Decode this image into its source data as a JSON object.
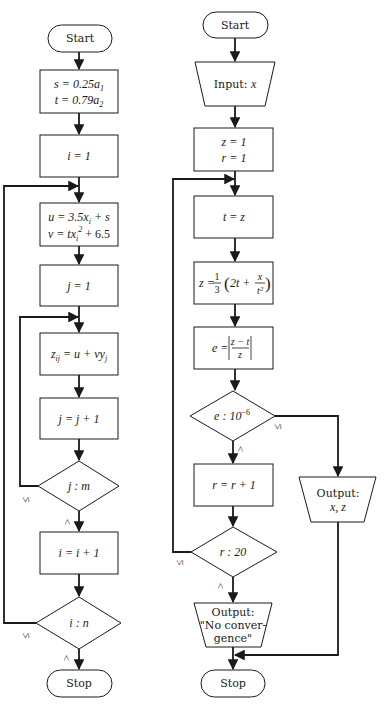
{
  "left_flowchart": {
    "start": "Start",
    "init_s": "s = 0.25a",
    "init_s_sub": "1",
    "init_t": "t = 0.79a",
    "init_t_sub": "2",
    "i_init": "i = 1",
    "u_expr": "u = 3.5x",
    "u_sub": "i",
    "u_tail": " + s",
    "v_expr": "v = tx",
    "v_sub": "i",
    "v_sup": "2",
    "v_tail": " + 6.5",
    "j_init": "j = 1",
    "z_expr": "z",
    "z_sub": "ij",
    "z_tail": " = u + vy",
    "z_tail_sub": "j",
    "j_inc": "j = j + 1",
    "j_test": "j : m",
    "j_test_le": "≤",
    "j_test_gt": ">",
    "i_inc": "i = i + 1",
    "i_test": "i : n",
    "i_test_le": "≤",
    "i_test_gt": ">",
    "stop": "Stop"
  },
  "right_flowchart": {
    "start": "Start",
    "input": "Input: ",
    "input_var": "x",
    "init_z": "z = 1",
    "init_r": "r = 1",
    "t_assign": "t = z",
    "z_update_lhs": "z = ",
    "z_update_frac_num": "1",
    "z_update_frac_den": "3",
    "z_update_body": "2t + ",
    "z_update_inner_num": "x",
    "z_update_inner_den": "t²",
    "e_lhs": "e = ",
    "e_num": "z − t",
    "e_den": "z",
    "e_test": "e : 10",
    "e_test_exp": "−6",
    "e_test_le": "≤",
    "e_test_gt": ">",
    "r_inc": "r = r + 1",
    "r_test": "r : 20",
    "r_test_le": "≤",
    "r_test_gt": ">",
    "output_result_label": "Output:",
    "output_result_vars": "x, z",
    "output_noconv_line1": "Output:",
    "output_noconv_line2": "\"No conver-",
    "output_noconv_line3": "gence\"",
    "stop": "Stop"
  },
  "colors": {
    "stroke": "#1a1a1a",
    "background": "#ffffff"
  }
}
